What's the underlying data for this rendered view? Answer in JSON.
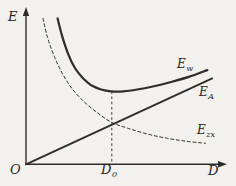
{
  "figure": {
    "background": "#f2f1ed",
    "ink": "#2f2d2a"
  },
  "labels": {
    "y_axis": "E",
    "x_axis": "D",
    "origin": "O",
    "optimum": {
      "base": "D",
      "sub": "0"
    }
  },
  "chart_data": {
    "type": "line",
    "title": "",
    "xlabel": "D",
    "ylabel": "E",
    "x_range": [
      0,
      10
    ],
    "y_range": [
      0,
      10
    ],
    "grid": false,
    "axes_numeric": false,
    "legend_position": "labels-at-line-ends",
    "x_ticks": [
      {
        "value": 4.4,
        "label": "D0"
      }
    ],
    "series": [
      {
        "name": "Ew",
        "label_base": "E",
        "label_sub": "w",
        "role": "total-cost-curve (U-shaped, minimum at D0)",
        "style": "solid",
        "width": 2.2,
        "points": [
          [
            1.62,
            9.6
          ],
          [
            1.85,
            8.45
          ],
          [
            2.15,
            7.3
          ],
          [
            2.5,
            6.35
          ],
          [
            2.9,
            5.7
          ],
          [
            3.35,
            5.2
          ],
          [
            3.85,
            4.92
          ],
          [
            4.36,
            4.8
          ],
          [
            5.0,
            4.8
          ],
          [
            5.7,
            4.92
          ],
          [
            6.5,
            5.12
          ],
          [
            7.4,
            5.4
          ],
          [
            8.35,
            5.75
          ],
          [
            9.3,
            6.2
          ]
        ]
      },
      {
        "name": "EA",
        "label_base": "E",
        "label_sub": "A",
        "role": "linearly-rising cost line through origin",
        "style": "solid",
        "width": 1.9,
        "points": [
          [
            0,
            0
          ],
          [
            9.55,
            5.65
          ]
        ]
      },
      {
        "name": "Ezx",
        "label_base": "E",
        "label_sub": "zx",
        "role": "decreasing hyperbolic cost curve",
        "style": "dashed",
        "width": 1,
        "points": [
          [
            0.87,
            9.6
          ],
          [
            1.1,
            8.35
          ],
          [
            1.45,
            7.1
          ],
          [
            1.85,
            6.0
          ],
          [
            2.35,
            5.0
          ],
          [
            2.95,
            4.15
          ],
          [
            3.6,
            3.45
          ],
          [
            4.36,
            2.78
          ],
          [
            5.2,
            2.38
          ],
          [
            6.2,
            2.0
          ],
          [
            7.2,
            1.72
          ],
          [
            8.2,
            1.52
          ],
          [
            9.2,
            1.38
          ]
        ]
      }
    ],
    "annotations": [
      {
        "type": "vline-dashed",
        "x": 4.4,
        "y_top": 4.8,
        "y_bottom": 0,
        "label": "D0",
        "meaning": "optimum abscissa under minimum of total curve / intersection of EA and Ezx"
      }
    ]
  }
}
